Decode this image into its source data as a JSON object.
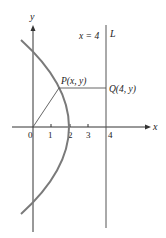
{
  "figure": {
    "axes": {
      "x_label": "x",
      "y_label": "y",
      "origin_label": "0"
    },
    "x_ticks": [
      "1",
      "2",
      "3",
      "4"
    ],
    "line": {
      "equation": "x = 4",
      "name": "L"
    },
    "point_p": "P(x, y)",
    "point_q": "Q(4, y)"
  },
  "colors": {
    "curve": "#7a7a7a",
    "axes": "#333333",
    "lines": "#555555"
  }
}
